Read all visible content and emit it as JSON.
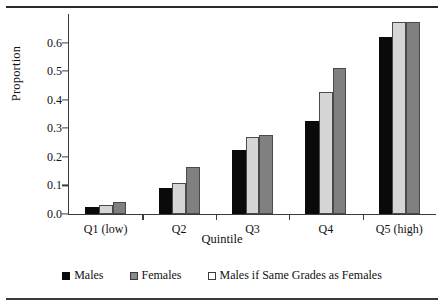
{
  "chart_data": {
    "type": "bar",
    "title": "",
    "xlabel": "Quintile",
    "ylabel": "Proportion",
    "categories": [
      "Q1 (low)",
      "Q2",
      "Q3",
      "Q4",
      "Q5 (high)"
    ],
    "series": [
      {
        "name": "Males",
        "color": "#0a0a0a",
        "values": [
          0.025,
          0.09,
          0.225,
          0.325,
          0.62
        ]
      },
      {
        "name": "Females",
        "color": "#d6d6d6",
        "values": [
          0.032,
          0.108,
          0.268,
          0.428,
          0.672
        ]
      },
      {
        "name": "Males if Same Grades as Females",
        "color": "#808080",
        "values": [
          0.042,
          0.163,
          0.275,
          0.51,
          0.673
        ]
      }
    ],
    "ylim": [
      0.0,
      0.7
    ],
    "yticks": [
      0.0,
      0.1,
      0.2,
      0.3,
      0.4,
      0.5,
      0.6
    ],
    "ytick_labels": [
      "0.0",
      "0.1",
      "0.2",
      "0.3",
      "0.4",
      "0.5",
      "0.6"
    ],
    "grid": false,
    "legend_position": "bottom"
  }
}
